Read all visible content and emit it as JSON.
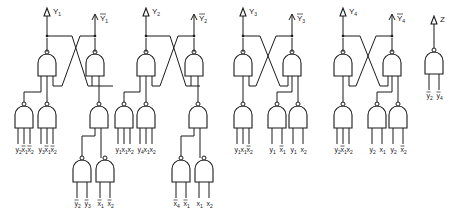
{
  "diagram": {
    "type": "logic-circuit",
    "colors": {
      "line": "#1a1a1a",
      "background": "#ffffff"
    },
    "outputs": [
      {
        "id": "Y1",
        "label": "Y",
        "sub": "1",
        "negated": false
      },
      {
        "id": "nY1",
        "label": "Y",
        "sub": "1",
        "negated": true
      },
      {
        "id": "Y2",
        "label": "Y",
        "sub": "2",
        "negated": false
      },
      {
        "id": "nY2",
        "label": "Y",
        "sub": "2",
        "negated": true
      },
      {
        "id": "Y3",
        "label": "Y",
        "sub": "3",
        "negated": false
      },
      {
        "id": "nY3",
        "label": "Y",
        "sub": "3",
        "negated": true
      },
      {
        "id": "Y4",
        "label": "Y",
        "sub": "4",
        "negated": false
      },
      {
        "id": "nY4",
        "label": "Y",
        "sub": "4",
        "negated": true
      },
      {
        "id": "Z",
        "label": "Z",
        "sub": "",
        "negated": false
      }
    ],
    "input_groups": [
      {
        "id": "g1a",
        "inputs": [
          {
            "v": "y",
            "s": "2",
            "bar": false
          },
          {
            "v": "x",
            "s": "1",
            "bar": true
          },
          {
            "v": "x",
            "s": "2",
            "bar": true
          }
        ]
      },
      {
        "id": "g1b",
        "inputs": [
          {
            "v": "y",
            "s": "3",
            "bar": false
          },
          {
            "v": "x",
            "s": "1",
            "bar": true
          },
          {
            "v": "x",
            "s": "2",
            "bar": true
          }
        ]
      },
      {
        "id": "g1c",
        "inputs": [
          {
            "v": "y",
            "s": "2",
            "bar": true
          },
          {
            "v": "y",
            "s": "3",
            "bar": true
          }
        ]
      },
      {
        "id": "g1d",
        "inputs": [
          {
            "v": "x",
            "s": "1",
            "bar": true
          },
          {
            "v": "x",
            "s": "2",
            "bar": true
          }
        ]
      },
      {
        "id": "g2a",
        "inputs": [
          {
            "v": "y",
            "s": "1",
            "bar": false
          },
          {
            "v": "x",
            "s": "1",
            "bar": false
          },
          {
            "v": "x",
            "s": "2",
            "bar": false
          }
        ]
      },
      {
        "id": "g2b",
        "inputs": [
          {
            "v": "y",
            "s": "4",
            "bar": false
          },
          {
            "v": "x",
            "s": "1",
            "bar": false
          },
          {
            "v": "x",
            "s": "2",
            "bar": false
          }
        ]
      },
      {
        "id": "g2c",
        "inputs": [
          {
            "v": "x",
            "s": "4",
            "bar": true
          },
          {
            "v": "x",
            "s": "1",
            "bar": true
          }
        ]
      },
      {
        "id": "g2d",
        "inputs": [
          {
            "v": "x",
            "s": "1",
            "bar": false
          },
          {
            "v": "x",
            "s": "2",
            "bar": false
          }
        ]
      },
      {
        "id": "g3a",
        "inputs": [
          {
            "v": "y",
            "s": "1",
            "bar": false
          },
          {
            "v": "x",
            "s": "1",
            "bar": false
          },
          {
            "v": "x",
            "s": "2",
            "bar": true
          }
        ]
      },
      {
        "id": "g3b",
        "inputs": [
          {
            "v": "y",
            "s": "1",
            "bar": false
          },
          {
            "v": "x",
            "s": "1",
            "bar": true
          }
        ]
      },
      {
        "id": "g3c",
        "inputs": [
          {
            "v": "y",
            "s": "1",
            "bar": false
          },
          {
            "v": "x",
            "s": "2",
            "bar": false
          }
        ]
      },
      {
        "id": "g4a",
        "inputs": [
          {
            "v": "y",
            "s": "2",
            "bar": false
          },
          {
            "v": "x",
            "s": "1",
            "bar": true
          },
          {
            "v": "x",
            "s": "2",
            "bar": false
          }
        ]
      },
      {
        "id": "g4b",
        "inputs": [
          {
            "v": "y",
            "s": "2",
            "bar": false
          },
          {
            "v": "x",
            "s": "1",
            "bar": false
          }
        ]
      },
      {
        "id": "g4c",
        "inputs": [
          {
            "v": "y",
            "s": "2",
            "bar": false
          },
          {
            "v": "x",
            "s": "2",
            "bar": true
          }
        ]
      },
      {
        "id": "gZ",
        "inputs": [
          {
            "v": "y",
            "s": "2",
            "bar": true
          },
          {
            "v": "y",
            "s": "4",
            "bar": true
          }
        ]
      }
    ]
  }
}
